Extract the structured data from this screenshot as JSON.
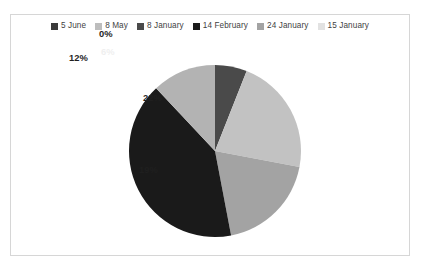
{
  "frame": {
    "border_color": "#d6d6d6",
    "background": "#ffffff"
  },
  "legend": {
    "position": "top-center",
    "items": [
      {
        "label": "5 June",
        "color": "#3a3a3a"
      },
      {
        "label": "8 May",
        "color": "#bdbdbd"
      },
      {
        "label": "8 January",
        "color": "#4a4a4a"
      },
      {
        "label": "14 February",
        "color": "#1a1a1a"
      },
      {
        "label": "24 January",
        "color": "#a3a3a3"
      },
      {
        "label": "15 January",
        "color": "#e2e2e2"
      }
    ]
  },
  "labels": {
    "zero": "0%",
    "six": "6%",
    "twentytwo": "22%",
    "nineteen": "19%",
    "twelve": "12%"
  },
  "chart_data": {
    "type": "pie",
    "title": "",
    "subtitle": "",
    "xlabel": "",
    "ylabel": "",
    "grid": false,
    "legend_position": "top-center",
    "data_labels": "percentage",
    "start_angle_deg": 0,
    "direction": "clockwise",
    "categories": [
      "5 June",
      "8 May",
      "8 January",
      "14 February",
      "24 January",
      "15 January"
    ],
    "values": [
      0,
      6,
      22,
      19,
      41,
      12
    ],
    "value_labels": [
      "0%",
      "6%",
      "22%",
      "19%",
      "",
      "12%"
    ],
    "colors": [
      "#3a3a3a",
      "#bdbdbd",
      "#4a4a4a",
      "#1a1a1a",
      "#a3a3a3",
      "#e2e2e2"
    ],
    "slices": [
      {
        "name": "5 June",
        "value": 0,
        "label": "0%",
        "color": "#3a3a3a",
        "label_shown": true,
        "label_outside": true
      },
      {
        "name": "8 May",
        "value": 6,
        "label": "6%",
        "color": "#4a4a4a",
        "label_shown": true,
        "label_outside": false
      },
      {
        "name": "8 January",
        "value": 22,
        "label": "22%",
        "color": "#c2c2c2",
        "label_shown": true,
        "label_outside": false
      },
      {
        "name": "14 February",
        "value": 19,
        "label": "19%",
        "color": "#a3a3a3",
        "label_shown": true,
        "label_outside": false
      },
      {
        "name": "24 January",
        "value": 41,
        "label": "",
        "color": "#1a1a1a",
        "label_shown": false,
        "label_outside": false
      },
      {
        "name": "15 January",
        "value": 12,
        "label": "12%",
        "color": "#b3b3b3",
        "label_shown": true,
        "label_outside": false
      }
    ],
    "total": 100
  }
}
